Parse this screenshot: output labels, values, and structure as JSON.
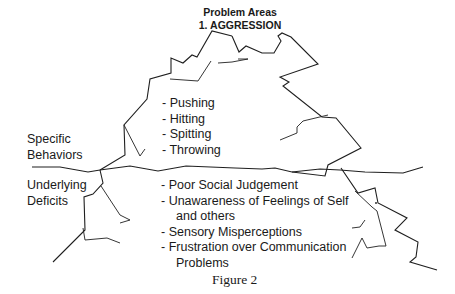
{
  "header": {
    "title": "Problem Areas",
    "subtitle": "1.  AGGRESSION"
  },
  "labels": {
    "above_line_1": "Specific",
    "above_line_2": "Behaviors",
    "below_line_1": "Underlying",
    "below_line_2": "Deficits"
  },
  "behaviors": [
    "- Pushing",
    "- Hitting",
    "- Spitting",
    "- Throwing"
  ],
  "deficits": [
    "- Poor Social Judgement",
    "- Unawareness of Feelings of Self",
    "and others",
    "- Sensory Misperceptions",
    "- Frustration over Communication",
    "Problems"
  ],
  "caption": "Figure 2",
  "colors": {
    "line": "#1f1f1f",
    "text": "#1a1a1a",
    "background": "#ffffff"
  }
}
